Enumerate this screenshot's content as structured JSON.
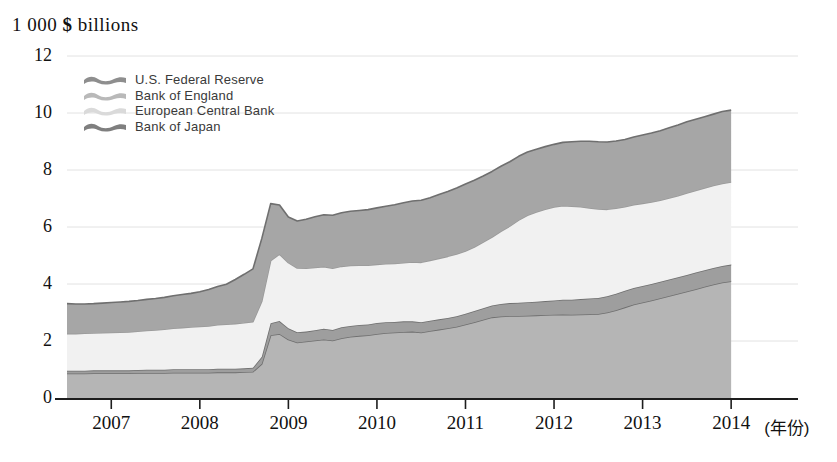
{
  "chart_data": {
    "type": "area",
    "stacked": true,
    "title": "1 000 $ billions",
    "xlabel": "(年份)",
    "ylabel": "1 000 $ billions",
    "ylim": [
      0,
      12
    ],
    "yticks": [
      0,
      2,
      4,
      6,
      8,
      10,
      12
    ],
    "grid": true,
    "legend_position": "top-left",
    "x": [
      2006.5,
      2006.6,
      2006.7,
      2006.8,
      2006.9,
      2007.0,
      2007.1,
      2007.2,
      2007.3,
      2007.4,
      2007.5,
      2007.6,
      2007.7,
      2007.8,
      2007.9,
      2008.0,
      2008.1,
      2008.2,
      2008.3,
      2008.4,
      2008.5,
      2008.6,
      2008.7,
      2008.8,
      2008.9,
      2009.0,
      2009.1,
      2009.2,
      2009.3,
      2009.4,
      2009.5,
      2009.6,
      2009.7,
      2009.8,
      2009.9,
      2010.0,
      2010.1,
      2010.2,
      2010.3,
      2010.4,
      2010.5,
      2010.6,
      2010.7,
      2010.8,
      2010.9,
      2011.0,
      2011.1,
      2011.2,
      2011.3,
      2011.4,
      2011.5,
      2011.6,
      2011.7,
      2011.8,
      2011.9,
      2012.0,
      2012.1,
      2012.2,
      2012.3,
      2012.4,
      2012.5,
      2012.6,
      2012.7,
      2012.8,
      2012.9,
      2013.0,
      2013.1,
      2013.2,
      2013.3,
      2013.4,
      2013.5,
      2013.6,
      2013.7,
      2013.8,
      2013.9,
      2014.0
    ],
    "xticks": [
      2007,
      2008,
      2009,
      2010,
      2011,
      2012,
      2013,
      2014
    ],
    "xlim": [
      2006.5,
      2014.1
    ],
    "series": [
      {
        "name": "U.S. Federal Reserve",
        "color": "#b5b5b5",
        "values": [
          0.86,
          0.86,
          0.86,
          0.87,
          0.87,
          0.87,
          0.87,
          0.87,
          0.88,
          0.88,
          0.88,
          0.88,
          0.89,
          0.89,
          0.89,
          0.89,
          0.89,
          0.9,
          0.9,
          0.9,
          0.91,
          0.92,
          1.2,
          2.2,
          2.25,
          2.05,
          1.95,
          1.98,
          2.02,
          2.05,
          2.02,
          2.1,
          2.15,
          2.18,
          2.2,
          2.25,
          2.28,
          2.3,
          2.32,
          2.33,
          2.3,
          2.35,
          2.4,
          2.45,
          2.5,
          2.58,
          2.66,
          2.75,
          2.83,
          2.86,
          2.88,
          2.88,
          2.89,
          2.9,
          2.91,
          2.92,
          2.93,
          2.92,
          2.93,
          2.94,
          2.95,
          3.0,
          3.08,
          3.18,
          3.28,
          3.35,
          3.42,
          3.5,
          3.58,
          3.66,
          3.74,
          3.82,
          3.9,
          3.98,
          4.05,
          4.1
        ]
      },
      {
        "name": "Bank of England",
        "color": "#9e9e9e",
        "values": [
          0.1,
          0.1,
          0.1,
          0.1,
          0.1,
          0.1,
          0.1,
          0.1,
          0.1,
          0.11,
          0.11,
          0.11,
          0.12,
          0.12,
          0.12,
          0.12,
          0.12,
          0.13,
          0.13,
          0.13,
          0.13,
          0.14,
          0.25,
          0.42,
          0.45,
          0.4,
          0.36,
          0.35,
          0.36,
          0.38,
          0.37,
          0.38,
          0.38,
          0.38,
          0.38,
          0.38,
          0.38,
          0.37,
          0.37,
          0.36,
          0.36,
          0.36,
          0.36,
          0.36,
          0.37,
          0.38,
          0.39,
          0.4,
          0.42,
          0.44,
          0.45,
          0.46,
          0.47,
          0.48,
          0.49,
          0.5,
          0.52,
          0.53,
          0.54,
          0.55,
          0.56,
          0.57,
          0.58,
          0.58,
          0.58,
          0.58,
          0.58,
          0.58,
          0.58,
          0.58,
          0.58,
          0.58,
          0.58,
          0.58,
          0.58,
          0.58
        ]
      },
      {
        "name": "European Central Bank",
        "color": "#f1f1f1",
        "values": [
          1.3,
          1.3,
          1.31,
          1.31,
          1.32,
          1.33,
          1.34,
          1.35,
          1.36,
          1.38,
          1.4,
          1.42,
          1.44,
          1.46,
          1.48,
          1.5,
          1.52,
          1.54,
          1.56,
          1.58,
          1.6,
          1.62,
          1.95,
          2.2,
          2.35,
          2.3,
          2.25,
          2.22,
          2.2,
          2.18,
          2.16,
          2.14,
          2.12,
          2.1,
          2.08,
          2.06,
          2.05,
          2.05,
          2.06,
          2.08,
          2.1,
          2.12,
          2.14,
          2.16,
          2.18,
          2.2,
          2.25,
          2.32,
          2.4,
          2.55,
          2.7,
          2.9,
          3.05,
          3.15,
          3.22,
          3.28,
          3.3,
          3.28,
          3.24,
          3.18,
          3.12,
          3.05,
          3.0,
          2.95,
          2.92,
          2.9,
          2.88,
          2.86,
          2.86,
          2.86,
          2.87,
          2.88,
          2.89,
          2.9,
          2.9,
          2.9
        ]
      },
      {
        "name": "Bank of Japan",
        "color": "#a6a6a6",
        "values": [
          1.05,
          1.04,
          1.03,
          1.03,
          1.04,
          1.05,
          1.06,
          1.07,
          1.08,
          1.09,
          1.1,
          1.12,
          1.14,
          1.16,
          1.18,
          1.22,
          1.28,
          1.34,
          1.4,
          1.55,
          1.7,
          1.85,
          2.2,
          2.0,
          1.72,
          1.6,
          1.65,
          1.72,
          1.78,
          1.82,
          1.86,
          1.88,
          1.9,
          1.92,
          1.95,
          1.98,
          2.02,
          2.06,
          2.1,
          2.14,
          2.18,
          2.2,
          2.24,
          2.28,
          2.32,
          2.35,
          2.34,
          2.32,
          2.3,
          2.28,
          2.26,
          2.24,
          2.22,
          2.2,
          2.2,
          2.2,
          2.22,
          2.26,
          2.3,
          2.34,
          2.36,
          2.36,
          2.36,
          2.36,
          2.38,
          2.4,
          2.42,
          2.44,
          2.46,
          2.48,
          2.5,
          2.5,
          2.5,
          2.5,
          2.52,
          2.52
        ]
      }
    ],
    "totals_note": {
      "start_total": 3.31,
      "peak_2008_total": 6.9,
      "end_total": 10.1
    }
  },
  "legend": {
    "items": [
      {
        "label": "U.S. Federal Reserve",
        "color": "#8e8e8e"
      },
      {
        "label": "Bank of England",
        "color": "#b9b9b9"
      },
      {
        "label": "European Central Bank",
        "color": "#d8d8d8"
      },
      {
        "label": "Bank of Japan",
        "color": "#7f7f7f"
      }
    ]
  },
  "axes": {
    "y_title": "1 000 $ billions",
    "y_title_prefix": "1 000",
    "y_title_currency": "$",
    "y_title_suffix": "billions",
    "y_tick_labels": [
      "12",
      "10",
      "8",
      "6",
      "4",
      "2",
      "0"
    ],
    "x_tick_labels": [
      "2007",
      "2008",
      "2009",
      "2010",
      "2011",
      "2012",
      "2013",
      "2014"
    ],
    "x_unit_label": "(年份)"
  }
}
